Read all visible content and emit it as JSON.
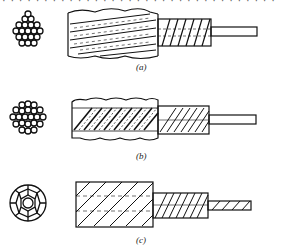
{
  "top_text_cropped": "· · · · · · · · · · · · · · · · · · · · · · · · · · · · · · · · ·",
  "figures": [
    {
      "id": "a",
      "label": "(a)",
      "cross_section": "hexagonal bundle of 19 round wires",
      "side_view": "stranded rope with helical outer layer, stripped inner strand and bare core wire"
    },
    {
      "id": "b",
      "label": "(b)",
      "cross_section": "round bundle of 19 round wires",
      "side_view": "stranded rope with densely hatched outer layer, hatched inner layer and bare core wire"
    },
    {
      "id": "c",
      "label": "(c)",
      "cross_section": "compacted circular strand with shaped wires around center",
      "side_view": "compacted rope with diagonal hatching, inner layer and hatched core"
    }
  ],
  "colors": {
    "line": "#111111",
    "background": "#ffffff"
  }
}
